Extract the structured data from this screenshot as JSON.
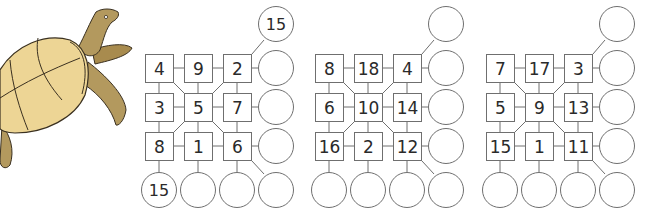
{
  "colors": {
    "shell": "#EDD595",
    "skin": "#B3995E",
    "outline": "#3a3020",
    "grid_line": "#6f6f6f"
  },
  "illustration": {
    "name": "turtle"
  },
  "puzzles": [
    {
      "grid": [
        [
          "4",
          "9",
          "2"
        ],
        [
          "3",
          "5",
          "7"
        ],
        [
          "8",
          "1",
          "6"
        ]
      ],
      "right_circles": [
        "",
        "",
        ""
      ],
      "corner_top_circle": "15",
      "bottom_circles": [
        "15",
        "",
        ""
      ],
      "corner_bottom_circle": ""
    },
    {
      "grid": [
        [
          "8",
          "18",
          "4"
        ],
        [
          "6",
          "10",
          "14"
        ],
        [
          "16",
          "2",
          "12"
        ]
      ],
      "right_circles": [
        "",
        "",
        ""
      ],
      "corner_top_circle": "",
      "bottom_circles": [
        "",
        "",
        ""
      ],
      "corner_bottom_circle": ""
    },
    {
      "grid": [
        [
          "7",
          "17",
          "3"
        ],
        [
          "5",
          "9",
          "13"
        ],
        [
          "15",
          "1",
          "11"
        ]
      ],
      "right_circles": [
        "",
        "",
        ""
      ],
      "corner_top_circle": "",
      "bottom_circles": [
        "",
        "",
        ""
      ],
      "corner_bottom_circle": ""
    }
  ]
}
